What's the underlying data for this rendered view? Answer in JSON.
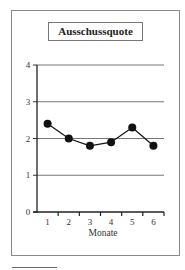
{
  "chart_data": {
    "type": "line",
    "title": "Ausschussquote",
    "xlabel": "Monate",
    "ylabel": "",
    "categories": [
      "1",
      "2",
      "3",
      "4",
      "5",
      "6"
    ],
    "series": [
      {
        "name": "Ausschussquote",
        "values": [
          2.4,
          2.0,
          1.8,
          1.9,
          2.3,
          1.8
        ],
        "marker": "filled-circle",
        "color": "#111111"
      }
    ],
    "yticks": [
      "0",
      "1",
      "2",
      "3",
      "4"
    ],
    "ylim": [
      0,
      4
    ],
    "grid": true,
    "legend": "none"
  }
}
